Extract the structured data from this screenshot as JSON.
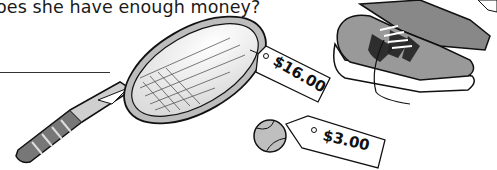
{
  "worksheet": {
    "question": "oes she have enough money?",
    "answer_line": ""
  },
  "items": [
    {
      "name": "tennis racket",
      "icon": "tennis-racket-icon",
      "price": "$16.00"
    },
    {
      "name": "tennis ball",
      "icon": "tennis-ball-icon",
      "price": "$3.00"
    },
    {
      "name": "sneakers",
      "icon": "sneakers-icon",
      "price": ""
    }
  ]
}
